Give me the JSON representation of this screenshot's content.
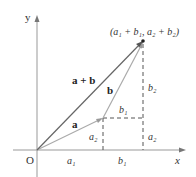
{
  "diagram": {
    "axes": {
      "x_label": "x",
      "y_label": "y",
      "origin_label": "O"
    },
    "vectors": {
      "a": {
        "label": "a"
      },
      "b": {
        "label": "b"
      },
      "sum": {
        "label": "a + b"
      }
    },
    "point_label": "(a₁ + b₁, a₂ + b₂)",
    "components": {
      "a1_x": "a₁",
      "b1_x": "b₁",
      "a2_left": "a₂",
      "a2_right": "a₂",
      "b1_mid": "b₁",
      "b2_right": "b₂"
    },
    "colors": {
      "axis": "#999999",
      "vector_a": "#aaaaaa",
      "vector_b": "#aaaaaa",
      "vector_sum": "#666666",
      "dashed": "#555555",
      "text": "#333333"
    }
  }
}
